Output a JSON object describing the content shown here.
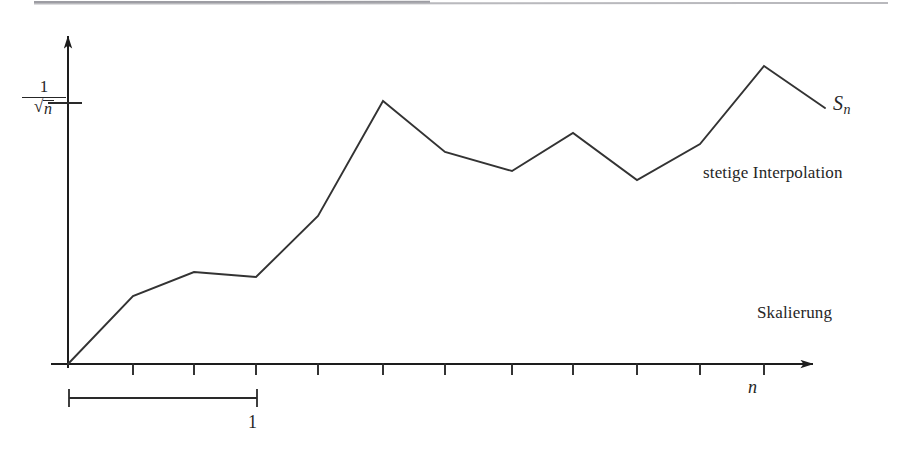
{
  "figure": {
    "background_color": "#ffffff",
    "ink_color": "#262626",
    "labels": {
      "y_axis_numerator": "1",
      "y_axis_denominator_radicand": "n",
      "y_axis_sqrt_glyph": "√",
      "series_label_base": "S",
      "series_label_sub": "n",
      "interpolation_note": "stetige Interpolation",
      "scaling_note": "Skalierung",
      "x_axis_label": "n",
      "bracket_label": "1"
    }
  },
  "chart_data": {
    "type": "line",
    "title": "",
    "xlabel": "n",
    "ylabel": "1/√n",
    "grid": false,
    "legend": "none",
    "annotations": [
      {
        "text": "S_n",
        "x": 12.3,
        "y": 0.752
      },
      {
        "text": "stetige Interpolation",
        "x": 9.2,
        "y": 0.55
      },
      {
        "text": "Skalierung",
        "x": 11.1,
        "y": 0.18
      },
      {
        "text": "1",
        "x": 3.0,
        "y": -0.18
      }
    ],
    "axis": {
      "x_origin_px": 68,
      "y_origin_px": 364,
      "x_tick_spacing_px": 62,
      "x_tick_count": 12,
      "y_tick_value_px": 103,
      "x_arrow_tip_px": 825,
      "y_arrow_tip_px": 28,
      "bracket_from_x": 0,
      "bracket_to_x": 3,
      "bracket_label": "1"
    },
    "x": [
      0,
      1,
      2,
      3,
      4,
      5,
      6,
      7,
      8,
      9,
      10,
      11,
      12
    ],
    "y": [
      0.0,
      0.261,
      0.353,
      0.334,
      0.568,
      1.009,
      0.813,
      0.74,
      0.886,
      0.706,
      0.844,
      1.144,
      0.983
    ],
    "points_px": [
      {
        "x": 68,
        "y": 364
      },
      {
        "x": 133,
        "y": 296
      },
      {
        "x": 194,
        "y": 272
      },
      {
        "x": 256,
        "y": 277
      },
      {
        "x": 318,
        "y": 216
      },
      {
        "x": 383,
        "y": 101
      },
      {
        "x": 445,
        "y": 152
      },
      {
        "x": 512,
        "y": 171
      },
      {
        "x": 573,
        "y": 133
      },
      {
        "x": 637,
        "y": 180
      },
      {
        "x": 700,
        "y": 144
      },
      {
        "x": 764,
        "y": 66
      },
      {
        "x": 825,
        "y": 108
      }
    ],
    "x_tick_positions_px": [
      133,
      194,
      256,
      318,
      383,
      445,
      512,
      573,
      637,
      700,
      764
    ],
    "ylim": [
      0,
      1.26
    ],
    "xlim": [
      0,
      12.4
    ]
  }
}
